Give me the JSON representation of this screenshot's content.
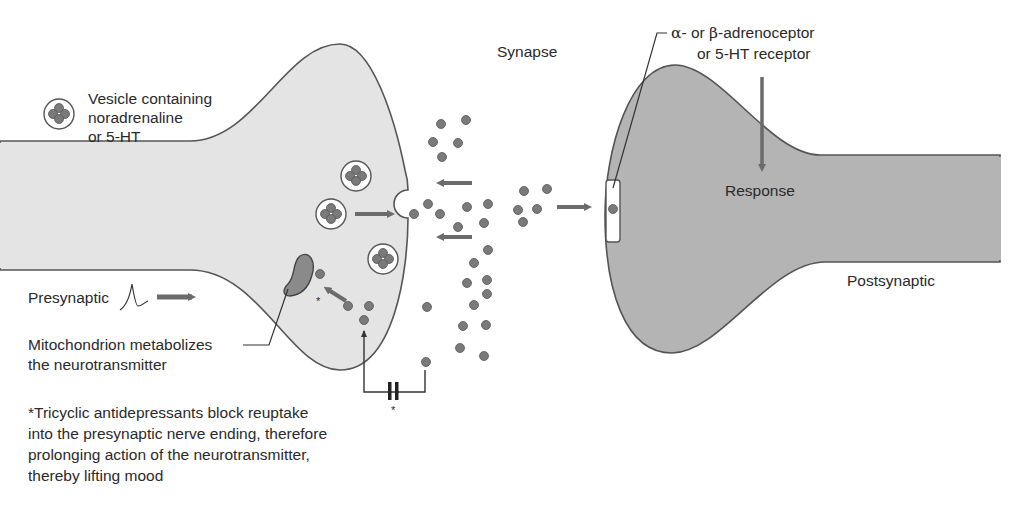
{
  "diagram": {
    "colors": {
      "presynaptic_fill": "#e4e4e4",
      "postsynaptic_fill": "#b4b4b4",
      "outline": "#555555",
      "molecule": "#7a7a7a",
      "arrow": "#6b6b6b",
      "text": "#2a2a2a"
    }
  },
  "labels": {
    "vesicle_legend": {
      "line1": "Vesicle containing",
      "line2": "noradrenaline",
      "line3": "or 5-HT"
    },
    "synapse": "Synapse",
    "receptor": {
      "line1_greek_alpha": "α",
      "line1_part1": "- or ",
      "line1_greek_beta": "β",
      "line1_part2": "-adrenoceptor",
      "line2": "or 5-HT receptor"
    },
    "response": "Response",
    "postsynaptic": "Postsynaptic",
    "presynaptic": "Presynaptic",
    "mitochondrion": {
      "line1": "Mitochondrion metabolizes",
      "line2": "the neurotransmitter"
    },
    "footnote": {
      "line1": "*Tricyclic antidepressants block reuptake",
      "line2": "into the presynaptic nerve ending, therefore",
      "line3": "prolonging action of the neurotransmitter,",
      "line4": "thereby lifting mood"
    },
    "asterisk": "*"
  },
  "icons": {
    "vesicle": "vesicle-icon",
    "neurotransmitter": "neurotransmitter-molecule-icon",
    "action_potential": "action-potential-icon",
    "mitochondrion": "mitochondrion-icon",
    "receptor": "receptor-icon",
    "block": "block-symbol-icon"
  }
}
